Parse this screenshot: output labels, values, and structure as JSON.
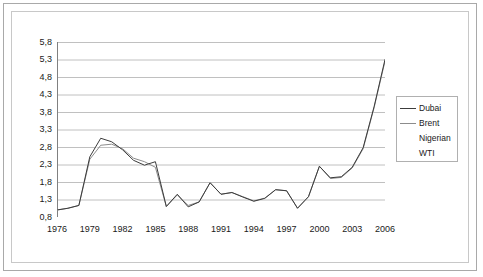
{
  "figure": {
    "kind": "line-chart-screenshot",
    "background_color": "#ffffff",
    "outer_border_color": "#a9a9a9",
    "plot_border_color": "#c8c8c8",
    "gridline_color": "#c0c0c0",
    "axis_color": "#808080",
    "tick_label_color": "#1a1a1a"
  },
  "legend": {
    "position": "right",
    "border_color": "#b0b0b0",
    "entries": [
      {
        "label": "Dubai",
        "color": "#3c3c3c",
        "has_line_sample": true
      },
      {
        "label": "Brent",
        "color": "#8c8c8c",
        "has_line_sample": true
      },
      {
        "label": "Nigerian",
        "color": "#ffffff",
        "has_line_sample": false
      },
      {
        "label": "WTI",
        "color": "#ffffff",
        "has_line_sample": false
      }
    ]
  },
  "chart_data": {
    "type": "line",
    "title": "",
    "subtitle": "",
    "xlabel": "",
    "ylabel": "",
    "decimal_separator": ",",
    "grid": true,
    "legend_position": "right",
    "xlim": [
      1976,
      2006
    ],
    "ylim": [
      0.8,
      5.8
    ],
    "ytick_step": 0.5,
    "ytick_labels": [
      "0,8",
      "1,3",
      "1,8",
      "2,3",
      "2,8",
      "3,3",
      "3,8",
      "4,3",
      "4,8",
      "5,3",
      "5,8"
    ],
    "ytick_values": [
      0.8,
      1.3,
      1.8,
      2.3,
      2.8,
      3.3,
      3.8,
      4.3,
      4.8,
      5.3,
      5.8
    ],
    "xtick_labels": [
      "1976",
      "1979",
      "1982",
      "1985",
      "1988",
      "1991",
      "1994",
      "1997",
      "2000",
      "2003",
      "2006"
    ],
    "xtick_values": [
      1976,
      1979,
      1982,
      1985,
      1988,
      1991,
      1994,
      1997,
      2000,
      2003,
      2006
    ],
    "minor_xticks_every": 1,
    "x": [
      1976,
      1977,
      1978,
      1979,
      1980,
      1981,
      1982,
      1983,
      1984,
      1985,
      1986,
      1987,
      1988,
      1989,
      1990,
      1991,
      1992,
      1993,
      1994,
      1995,
      1996,
      1997,
      1998,
      1999,
      2000,
      2001,
      2002,
      2003,
      2004,
      2005,
      2006
    ],
    "series": [
      {
        "name": "Dubai",
        "color": "#3c3c3c",
        "values": [
          1.0,
          1.05,
          1.13,
          2.52,
          3.05,
          2.95,
          2.72,
          2.42,
          2.28,
          2.38,
          1.1,
          1.45,
          1.09,
          1.23,
          1.78,
          1.45,
          1.5,
          1.37,
          1.25,
          1.33,
          1.58,
          1.55,
          1.05,
          1.38,
          2.25,
          1.92,
          1.95,
          2.22,
          2.78,
          3.95,
          5.3
        ]
      },
      {
        "name": "Brent",
        "color": "#8c8c8c",
        "values": [
          1.0,
          1.05,
          1.13,
          2.45,
          2.85,
          2.88,
          2.75,
          2.48,
          2.38,
          2.22,
          1.1,
          1.43,
          1.13,
          1.23,
          1.78,
          1.45,
          1.5,
          1.38,
          1.26,
          1.34,
          1.58,
          1.55,
          1.05,
          1.38,
          2.25,
          1.9,
          1.93,
          2.2,
          2.75,
          3.92,
          5.25
        ]
      },
      {
        "name": "Nigerian",
        "color": "#ffffff",
        "values": [
          1.0,
          1.05,
          1.13,
          2.48,
          2.95,
          2.9,
          2.74,
          2.45,
          2.33,
          2.3,
          1.1,
          1.44,
          1.11,
          1.23,
          1.78,
          1.45,
          1.5,
          1.37,
          1.25,
          1.33,
          1.58,
          1.55,
          1.05,
          1.38,
          2.25,
          1.91,
          1.94,
          2.21,
          2.76,
          3.93,
          5.28
        ]
      },
      {
        "name": "WTI",
        "color": "#ffffff",
        "values": [
          1.0,
          1.05,
          1.13,
          2.5,
          3.0,
          2.92,
          2.73,
          2.44,
          2.3,
          2.34,
          1.1,
          1.44,
          1.1,
          1.23,
          1.78,
          1.45,
          1.5,
          1.37,
          1.25,
          1.33,
          1.58,
          1.55,
          1.05,
          1.38,
          2.25,
          1.92,
          1.94,
          2.21,
          2.77,
          3.94,
          5.29
        ]
      }
    ]
  }
}
